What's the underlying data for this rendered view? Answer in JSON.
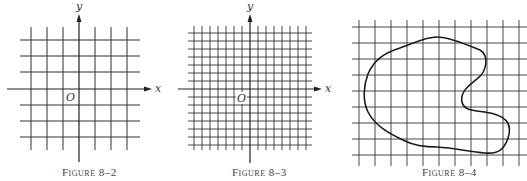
{
  "figures": [
    {
      "id": "fig-8-2",
      "caption": "Figure 8–2",
      "axis_labels": {
        "x": "x",
        "y": "y",
        "origin": "O"
      },
      "grid": {
        "spacing_px": 16,
        "vertical_lines": 7,
        "horizontal_lines": 7,
        "note": "coarse grid with coordinate axes"
      }
    },
    {
      "id": "fig-8-3",
      "caption": "Figure 8–3",
      "axis_labels": {
        "x": "x",
        "y": "y",
        "origin": "O"
      },
      "grid": {
        "spacing_px": 8,
        "vertical_lines": 15,
        "horizontal_lines": 15,
        "note": "finer grid with coordinate axes"
      }
    },
    {
      "id": "fig-8-4",
      "caption": "Figure 8–4",
      "grid": {
        "spacing_px": 16,
        "vertical_lines": 11,
        "horizontal_lines": 9,
        "note": "grid overlaid on an irregular closed region"
      },
      "region": "irregular closed curve (blob) with an indentation on the right side"
    }
  ],
  "colors": {
    "line": "#222222",
    "grid": "#333333",
    "background": "#ffffff"
  }
}
